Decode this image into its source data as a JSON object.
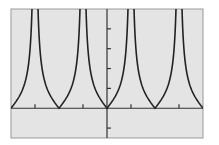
{
  "chart_data": {
    "type": "line",
    "title": "",
    "function": "y = |tan x|",
    "xlabel": "",
    "ylabel": "",
    "xlim": [
      -6.2832,
      6.2832
    ],
    "ylim": [
      -1.5,
      5
    ],
    "x_ticks": [
      -4.7124,
      -1.5708,
      1.5708,
      4.7124
    ],
    "y_ticks": [
      -1,
      1,
      2,
      3,
      4
    ],
    "grid": false,
    "legend": null,
    "series": [
      {
        "name": "|tan x|",
        "zeros": [
          -6.2832,
          -3.1416,
          0,
          3.1416,
          6.2832
        ],
        "asymptotes": [
          -4.7124,
          -1.5708,
          1.5708,
          4.7124
        ]
      }
    ],
    "colors": {
      "background": "#e4e4e4",
      "curve": "#222222",
      "axes": "#333333",
      "frame": "#888888"
    }
  }
}
